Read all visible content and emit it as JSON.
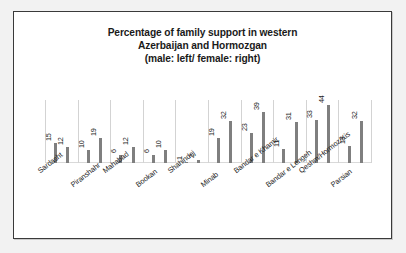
{
  "chart_data": {
    "type": "bar",
    "title": "Percentage of family support in western Azerbaijan and Hormozgan (male: left/ female: right)",
    "title_lines": [
      "Percentage of family support in western",
      "Azerbaijan and Hormozgan",
      "(male: left/ female: right)"
    ],
    "xlabel": "",
    "ylabel": "",
    "ylim": [
      0,
      48
    ],
    "grid": "vertical-category-separators",
    "legend": "none (encoded in title: male = left bar, female = right bar)",
    "bar_color": "#7f7f7f",
    "categories": [
      "Sardasht",
      "Piranshahr",
      "Mahabad",
      "Bookan",
      "Shahindej",
      "Minab",
      "Bandar e Khamir",
      "Bandar e Lengeh",
      "Qeshm/Hormoz/Kis",
      "Parsian"
    ],
    "series": [
      {
        "name": "male",
        "values": [
          15,
          10,
          6,
          6,
          1,
          19,
          23,
          11,
          33,
          13
        ]
      },
      {
        "name": "female",
        "values": [
          12,
          19,
          12,
          10,
          2,
          32,
          39,
          31,
          44,
          32
        ]
      }
    ],
    "bars": [
      {
        "category": "Sardasht",
        "group": "male",
        "value": 15,
        "label": "15"
      },
      {
        "category": "Sardasht",
        "group": "female",
        "value": 12,
        "label": "12"
      },
      {
        "category": "Piranshahr",
        "group": "male",
        "value": 10,
        "label": "10"
      },
      {
        "category": "Piranshahr",
        "group": "female",
        "value": 19,
        "label": "19"
      },
      {
        "category": "Mahabad",
        "group": "male",
        "value": 6,
        "label": "6"
      },
      {
        "category": "Mahabad",
        "group": "female",
        "value": 12,
        "label": "12"
      },
      {
        "category": "Bookan",
        "group": "male",
        "value": 6,
        "label": "6"
      },
      {
        "category": "Bookan",
        "group": "female",
        "value": 10,
        "label": "10"
      },
      {
        "category": "Shahindej",
        "group": "male",
        "value": 1,
        "label": "1"
      },
      {
        "category": "Shahindej",
        "group": "female",
        "value": 2,
        "label": "2"
      },
      {
        "category": "Minab",
        "group": "male",
        "value": 19,
        "label": "19"
      },
      {
        "category": "Minab",
        "group": "female",
        "value": 32,
        "label": "32"
      },
      {
        "category": "Bandar e Khamir",
        "group": "male",
        "value": 23,
        "label": "23"
      },
      {
        "category": "Bandar e Khamir",
        "group": "female",
        "value": 39,
        "label": "39"
      },
      {
        "category": "Bandar e Lengeh",
        "group": "male",
        "value": 11,
        "label": "11"
      },
      {
        "category": "Bandar e Lengeh",
        "group": "female",
        "value": 31,
        "label": "31"
      },
      {
        "category": "Qeshm/Hormoz/Kis",
        "group": "male",
        "value": 33,
        "label": "33"
      },
      {
        "category": "Qeshm/Hormoz/Kis",
        "group": "female",
        "value": 44,
        "label": "44"
      },
      {
        "category": "Parsian",
        "group": "male",
        "value": 13,
        "label": "13"
      },
      {
        "category": "Parsian",
        "group": "female",
        "value": 32,
        "label": "32"
      }
    ]
  }
}
